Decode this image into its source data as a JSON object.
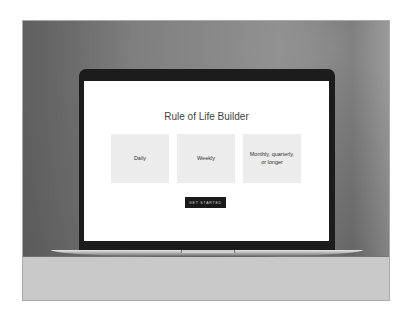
{
  "screen": {
    "title": "Rule of Life Builder",
    "cards": [
      {
        "label": "Daily"
      },
      {
        "label": "Weekly"
      },
      {
        "label": "Monthly, quarterly, or longer"
      }
    ],
    "cta_label": "GET STARTED"
  },
  "colors": {
    "button_bg": "#1a1a1a",
    "card_bg": "#ececec",
    "title_text": "#444444"
  }
}
